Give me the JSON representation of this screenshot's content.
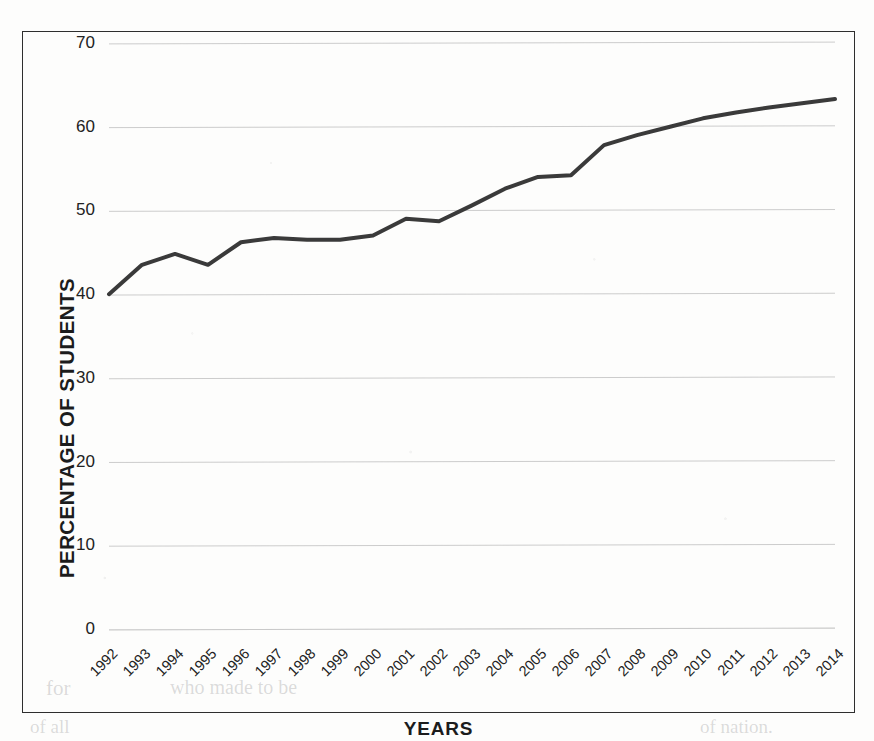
{
  "chart_data": {
    "type": "line",
    "title": "",
    "xlabel": "YEARS",
    "ylabel": "PERCENTAGE OF STUDENTS",
    "categories": [
      "1992",
      "1993",
      "1994",
      "1995",
      "1996",
      "1997",
      "1998",
      "1999",
      "2000",
      "2001",
      "2002",
      "2003",
      "2004",
      "2005",
      "2006",
      "2007",
      "2008",
      "2009",
      "2010",
      "2011",
      "2012",
      "2013",
      "2014"
    ],
    "values": [
      40.0,
      43.5,
      44.8,
      43.5,
      46.2,
      46.7,
      46.5,
      46.5,
      47.0,
      49.0,
      48.7,
      50.6,
      52.6,
      54.0,
      54.2,
      57.8,
      59.0,
      60.0,
      61.0,
      61.7,
      62.3,
      62.8,
      63.3
    ],
    "series": [
      {
        "name": "Percentage of students",
        "values": [
          40.0,
          43.5,
          44.8,
          43.5,
          46.2,
          46.7,
          46.5,
          46.5,
          47.0,
          49.0,
          48.7,
          50.6,
          52.6,
          54.0,
          54.2,
          57.8,
          59.0,
          60.0,
          61.0,
          61.7,
          62.3,
          62.8,
          63.3
        ],
        "color": "#3a3a3a"
      }
    ],
    "ylim": [
      0,
      70
    ],
    "yticks": [
      0,
      10,
      20,
      30,
      40,
      50,
      60,
      70
    ],
    "ytick_labels": [
      "0",
      "10",
      "20",
      "30",
      "40",
      "50",
      "60",
      "70"
    ],
    "xtick_rotation": -45,
    "grid": "horizontal",
    "grid_color": "#c9c9c9",
    "legend": "none",
    "line_color": "#3a3a3a",
    "line_width": 4,
    "markers": "none",
    "frame_color": "#2e2e2e",
    "background": "#fdfdfc"
  },
  "page": {
    "bleed_text_left": "for",
    "bleed_text_mid": "who made to be",
    "bleed_text_bottom_left": "of all",
    "bleed_text_bottom_right": "of nation."
  }
}
